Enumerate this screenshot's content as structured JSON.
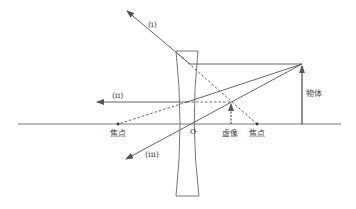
{
  "diagram": {
    "title": "",
    "colors": {
      "line": "#555555",
      "text": "#444444",
      "background": "#ffffff"
    },
    "labels": {
      "ray_i": "(i)",
      "ray_ii": "(ii)",
      "ray_iii": "(iii)",
      "focus_left": "焦点",
      "focus_right": "焦点",
      "center": "O",
      "virtual_image": "虚像",
      "object": "物体"
    },
    "elements": {
      "optical_axis": {
        "y": 124,
        "x_start": 18,
        "x_end": 341
      },
      "concave_lens": {
        "center_x": 187,
        "top_y": 51,
        "bottom_y": 196
      },
      "object_arrow": {
        "x": 302,
        "top_y": 64
      },
      "virtual_image_arrow": {
        "x": 231,
        "top_y": 102
      },
      "focal_points": [
        {
          "x": 118,
          "y": 124
        },
        {
          "x": 257,
          "y": 124
        }
      ]
    }
  }
}
